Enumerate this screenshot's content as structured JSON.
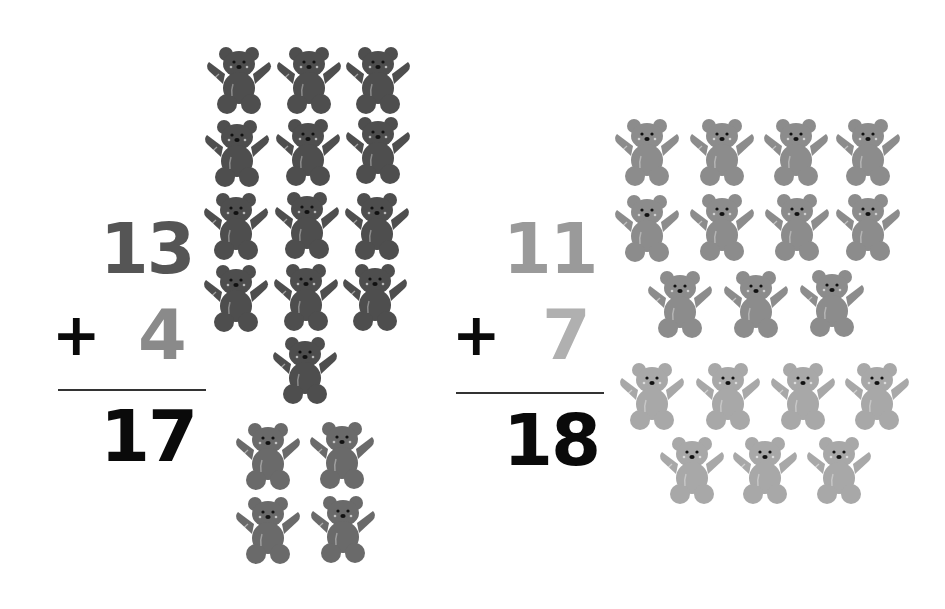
{
  "problems": [
    {
      "addend1": "13",
      "operator": "+",
      "addend2": "4",
      "sum": "17",
      "colors": {
        "addend1": "#555555",
        "addend2": "#8a8a8a",
        "sum": "#0a0a0a",
        "bear_group1": "#4e4e4e",
        "bear_group2": "#6a6a6a"
      },
      "bear_group1_count": 13,
      "bear_group2_count": 4
    },
    {
      "addend1": "11",
      "operator": "+",
      "addend2": "7",
      "sum": "18",
      "colors": {
        "addend1": "#9a9a9a",
        "addend2": "#b0b0b0",
        "sum": "#0a0a0a",
        "bear_group1": "#8c8c8c",
        "bear_group2": "#a8a8a8"
      },
      "bear_group1_count": 11,
      "bear_group2_count": 7
    }
  ],
  "icons": {
    "bear": "teddy-bear-counter-icon"
  }
}
